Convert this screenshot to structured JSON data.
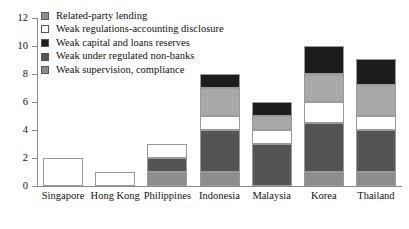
{
  "chart_data": {
    "type": "bar",
    "subtype": "stacked-vertical",
    "title": "",
    "xlabel": "",
    "ylabel": "",
    "ylim": [
      0,
      12
    ],
    "ytick_values": [
      0,
      2,
      4,
      6,
      8,
      10,
      12
    ],
    "ytick_labels": [
      "0",
      "2",
      "4",
      "6",
      "8",
      "10",
      "12"
    ],
    "grid": false,
    "legend_position": "top-left",
    "categories": [
      "Singapore",
      "Hong Kong",
      "Philippines",
      "Indonesia",
      "Malaysia",
      "Korea",
      "Thailand"
    ],
    "series": [
      {
        "name": "Weak supervision, compliance",
        "color": "#8c8c8c",
        "values": [
          0,
          0,
          1,
          1,
          0,
          1,
          1
        ]
      },
      {
        "name": "Weak under regulated non-banks",
        "color": "#545454",
        "values": [
          0,
          0,
          1,
          3,
          3,
          3.5,
          3
        ]
      },
      {
        "name": "Weak capital and loans reserves",
        "color": "#ffffff",
        "values": [
          2,
          1,
          1,
          1,
          1,
          1.5,
          1
        ]
      },
      {
        "name": "Weak regulations-accounting disclosure",
        "color": "#a8a8a8",
        "values": [
          0,
          0,
          0,
          2,
          1,
          2,
          2.2
        ]
      },
      {
        "name": "Related-party lending",
        "color": "#1c1c1c",
        "values": [
          0,
          0,
          0,
          1,
          1,
          2,
          1.9
        ]
      }
    ],
    "totals": [
      2,
      1,
      3,
      8,
      6,
      10,
      9.1
    ],
    "legend_entries": [
      {
        "label": "Related-party lending",
        "swatch": "#8c8c8c"
      },
      {
        "label": "Weak regulations-accounting disclosure",
        "swatch": "#ffffff"
      },
      {
        "label": "Weak capital and loans reserves",
        "swatch": "#1c1c1c"
      },
      {
        "label": "Weak under regulated non-banks",
        "swatch": "#545454"
      },
      {
        "label": "Weak supervision, compliance",
        "swatch": "#8c8c8c"
      }
    ]
  }
}
